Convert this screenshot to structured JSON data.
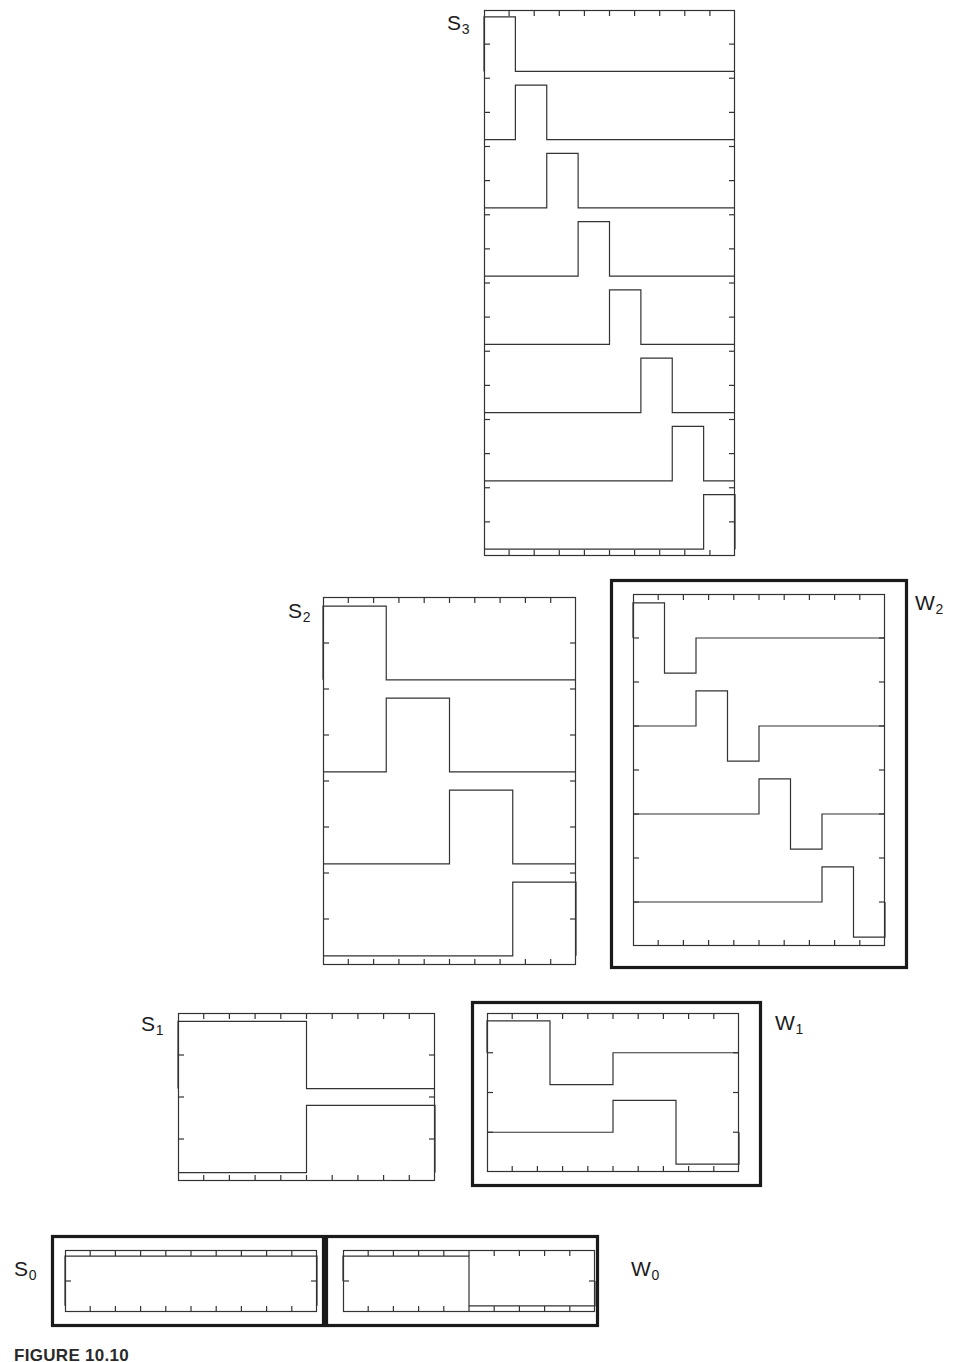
{
  "figure": {
    "caption": "FIGURE 10.10",
    "background_color": "#ffffff",
    "line_color": "#333333",
    "heavy_border_color": "#1a1a1a"
  },
  "panels": [
    {
      "id": "S3",
      "label": "S",
      "sublabel": "3",
      "label_position": "left-top",
      "label_x": 447,
      "label_y": 12,
      "box": {
        "x": 484,
        "y": 10,
        "w": 251,
        "h": 546
      },
      "heavy_box": null,
      "tick_divisions": 10,
      "subplot_count": 8,
      "kind": "scaling",
      "description": "Eight Haar scaling functions at level 3 stacked vertically"
    },
    {
      "id": "S2",
      "label": "S",
      "sublabel": "2",
      "label_position": "left-top",
      "label_x": 288,
      "label_y": 600,
      "box": {
        "x": 323,
        "y": 597,
        "w": 253,
        "h": 368
      },
      "heavy_box": null,
      "tick_divisions": 10,
      "subplot_count": 4,
      "kind": "scaling",
      "description": "Four Haar scaling functions at level 2 stacked vertically"
    },
    {
      "id": "W2",
      "label": "W",
      "sublabel": "2",
      "label_position": "right-top",
      "label_x": 915,
      "label_y": 592,
      "box": {
        "x": 633,
        "y": 594,
        "w": 252,
        "h": 352
      },
      "heavy_box": {
        "x": 610,
        "y": 579,
        "w": 298,
        "h": 390
      },
      "tick_divisions": 10,
      "subplot_count": 4,
      "kind": "wavelet",
      "description": "Four Haar wavelets at level 2 stacked vertically"
    },
    {
      "id": "S1",
      "label": "S",
      "sublabel": "1",
      "label_position": "left-top",
      "label_x": 141,
      "label_y": 1013,
      "box": {
        "x": 178,
        "y": 1013,
        "w": 257,
        "h": 168
      },
      "heavy_box": null,
      "tick_divisions": 10,
      "subplot_count": 2,
      "kind": "scaling",
      "description": "Two Haar scaling functions at level 1 stacked vertically"
    },
    {
      "id": "W1",
      "label": "W",
      "sublabel": "1",
      "label_position": "right-top",
      "label_x": 775,
      "label_y": 1012,
      "box": {
        "x": 487,
        "y": 1013,
        "w": 252,
        "h": 159
      },
      "heavy_box": {
        "x": 471,
        "y": 1001,
        "w": 291,
        "h": 186
      },
      "tick_divisions": 10,
      "subplot_count": 2,
      "kind": "wavelet",
      "description": "Two Haar wavelets at level 1 stacked vertically"
    },
    {
      "id": "S0",
      "label": "S",
      "sublabel": "0",
      "label_position": "left-middle",
      "label_x": 14,
      "label_y": 1258,
      "box": {
        "x": 65,
        "y": 1250,
        "w": 252,
        "h": 62
      },
      "heavy_box": {
        "x": 51,
        "y": 1235,
        "w": 274,
        "h": 92
      },
      "tick_divisions": 10,
      "subplot_count": 1,
      "kind": "scaling",
      "description": "Single Haar scaling function at level 0 (constant)"
    },
    {
      "id": "W0",
      "label": "W",
      "sublabel": "0",
      "label_position": "right-middle",
      "label_x": 631,
      "label_y": 1258,
      "box": {
        "x": 343,
        "y": 1250,
        "w": 252,
        "h": 62
      },
      "heavy_box": {
        "x": 325,
        "y": 1235,
        "w": 274,
        "h": 92
      },
      "tick_divisions": 10,
      "subplot_count": 1,
      "kind": "wavelet",
      "description": "Single Haar wavelet at level 0 (one up-down square pulse)"
    }
  ],
  "chart_data": {
    "type": "line",
    "xlabel": "",
    "ylabel": "",
    "xlim": [
      0,
      1
    ],
    "ylim": [
      -1,
      1
    ],
    "grid": false,
    "legend": "none",
    "axis_tick_divisions": 10,
    "basis_functions": [
      {
        "panel": "S3",
        "level": 3,
        "space": "S",
        "count": 8,
        "support_width": 0.125,
        "functions": [
          {
            "index": 0,
            "support": [
              0.0,
              0.125
            ],
            "high": 1,
            "low": 0
          },
          {
            "index": 1,
            "support": [
              0.125,
              0.25
            ],
            "high": 1,
            "low": 0
          },
          {
            "index": 2,
            "support": [
              0.25,
              0.375
            ],
            "high": 1,
            "low": 0
          },
          {
            "index": 3,
            "support": [
              0.375,
              0.5
            ],
            "high": 1,
            "low": 0
          },
          {
            "index": 4,
            "support": [
              0.5,
              0.625
            ],
            "high": 1,
            "low": 0
          },
          {
            "index": 5,
            "support": [
              0.625,
              0.75
            ],
            "high": 1,
            "low": 0
          },
          {
            "index": 6,
            "support": [
              0.75,
              0.875
            ],
            "high": 1,
            "low": 0
          },
          {
            "index": 7,
            "support": [
              0.875,
              1.0
            ],
            "high": 1,
            "low": 0
          }
        ]
      },
      {
        "panel": "S2",
        "level": 2,
        "space": "S",
        "count": 4,
        "support_width": 0.25,
        "functions": [
          {
            "index": 0,
            "support": [
              0.0,
              0.25
            ],
            "high": 1,
            "low": 0
          },
          {
            "index": 1,
            "support": [
              0.25,
              0.5
            ],
            "high": 1,
            "low": 0
          },
          {
            "index": 2,
            "support": [
              0.5,
              0.75
            ],
            "high": 1,
            "low": 0
          },
          {
            "index": 3,
            "support": [
              0.75,
              1.0
            ],
            "high": 1,
            "low": 0
          }
        ]
      },
      {
        "panel": "W2",
        "level": 2,
        "space": "W",
        "count": 4,
        "support_width": 0.25,
        "functions": [
          {
            "index": 0,
            "support": [
              0.0,
              0.25
            ],
            "positive": [
              0.0,
              0.125
            ],
            "negative": [
              0.125,
              0.25
            ]
          },
          {
            "index": 1,
            "support": [
              0.25,
              0.5
            ],
            "positive": [
              0.25,
              0.375
            ],
            "negative": [
              0.375,
              0.5
            ]
          },
          {
            "index": 2,
            "support": [
              0.5,
              0.75
            ],
            "positive": [
              0.5,
              0.625
            ],
            "negative": [
              0.625,
              0.75
            ]
          },
          {
            "index": 3,
            "support": [
              0.75,
              1.0
            ],
            "positive": [
              0.75,
              0.875
            ],
            "negative": [
              0.875,
              1.0
            ]
          }
        ]
      },
      {
        "panel": "S1",
        "level": 1,
        "space": "S",
        "count": 2,
        "support_width": 0.5,
        "functions": [
          {
            "index": 0,
            "support": [
              0.0,
              0.5
            ],
            "high": 1,
            "low": 0
          },
          {
            "index": 1,
            "support": [
              0.5,
              1.0
            ],
            "high": 1,
            "low": 0
          }
        ]
      },
      {
        "panel": "W1",
        "level": 1,
        "space": "W",
        "count": 2,
        "support_width": 0.5,
        "functions": [
          {
            "index": 0,
            "support": [
              0.0,
              0.5
            ],
            "positive": [
              0.0,
              0.25
            ],
            "negative": [
              0.25,
              0.5
            ]
          },
          {
            "index": 1,
            "support": [
              0.5,
              1.0
            ],
            "positive": [
              0.5,
              0.75
            ],
            "negative": [
              0.75,
              1.0
            ]
          }
        ]
      },
      {
        "panel": "S0",
        "level": 0,
        "space": "S",
        "count": 1,
        "support_width": 1.0,
        "functions": [
          {
            "index": 0,
            "support": [
              0.0,
              1.0
            ],
            "high": 1,
            "low": 0
          }
        ]
      },
      {
        "panel": "W0",
        "level": 0,
        "space": "W",
        "count": 1,
        "support_width": 1.0,
        "functions": [
          {
            "index": 0,
            "support": [
              0.0,
              1.0
            ],
            "positive": [
              0.0,
              0.5
            ],
            "negative": [
              0.5,
              1.0
            ]
          }
        ]
      }
    ]
  }
}
